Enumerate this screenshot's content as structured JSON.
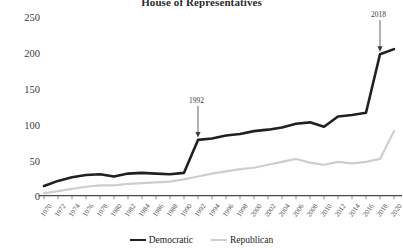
{
  "chart_data": {
    "type": "line",
    "title": "House of Representatives",
    "xlabel": "",
    "ylabel": "",
    "ylim": [
      0,
      250
    ],
    "yticks": [
      0,
      50,
      100,
      150,
      200,
      250
    ],
    "grid": false,
    "legend_position": "bottom",
    "x": [
      1970,
      1972,
      1974,
      1976,
      1978,
      1980,
      1982,
      1984,
      1986,
      1988,
      1990,
      1992,
      1994,
      1996,
      1998,
      2000,
      2002,
      2004,
      2006,
      2008,
      2010,
      2012,
      2014,
      2016,
      2018,
      2020
    ],
    "categories": [
      "1970",
      "1972",
      "1974",
      "1976",
      "1978",
      "1980",
      "1982",
      "1984",
      "1986",
      "1988",
      "1990",
      "1992",
      "1994",
      "1996",
      "1998",
      "2000",
      "2002",
      "2004",
      "2006",
      "2008",
      "2010",
      "2012",
      "2014",
      "2016",
      "2018",
      "2020"
    ],
    "series": [
      {
        "name": "Democratic",
        "color": "#231f20",
        "values": [
          15,
          22,
          27,
          30,
          31,
          28,
          32,
          33,
          32,
          31,
          33,
          78,
          80,
          84,
          86,
          90,
          92,
          95,
          100,
          102,
          96,
          110,
          112,
          115,
          195,
          202
        ]
      },
      {
        "name": "Republican",
        "color": "#cfcfc9",
        "values": [
          5,
          8,
          11,
          14,
          16,
          16,
          18,
          19,
          20,
          21,
          24,
          28,
          32,
          35,
          38,
          40,
          44,
          48,
          52,
          47,
          44,
          48,
          46,
          48,
          52,
          90
        ]
      }
    ],
    "annotations": [
      {
        "label": "1992",
        "x": 1992,
        "y": 78
      },
      {
        "label": "2018",
        "x": 2018,
        "y": 195
      }
    ]
  },
  "legend": {
    "items": [
      {
        "label": "Democratic",
        "color": "#231f20"
      },
      {
        "label": "Republican",
        "color": "#cfcfc9"
      }
    ]
  }
}
